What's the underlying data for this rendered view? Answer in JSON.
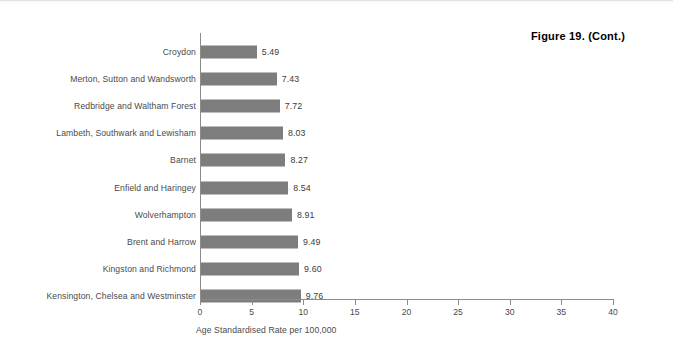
{
  "figure": {
    "caption": "Figure 19. (Cont.)"
  },
  "chart_data": {
    "type": "bar",
    "orientation": "horizontal",
    "title": "Figure 19. (Cont.)",
    "xlabel": "Age Standardised Rate per 100,000",
    "ylabel": "",
    "xlim": [
      0,
      40
    ],
    "xticks": [
      0,
      5,
      10,
      15,
      20,
      25,
      30,
      35,
      40
    ],
    "xtick_labels": [
      "0",
      "5",
      "10",
      "15",
      "20",
      "25",
      "30",
      "35",
      "40"
    ],
    "grid": false,
    "legend": false,
    "bar_color": "#7d7d7d",
    "axis_color": "#8c8c8c",
    "categories": [
      "Croydon",
      "Merton, Sutton and Wandsworth",
      "Redbridge and Waltham Forest",
      "Lambeth, Southwark and Lewisham",
      "Barnet",
      "Enfield and Haringey",
      "Wolverhampton",
      "Brent and Harrow",
      "Kingston and Richmond",
      "Kensington, Chelsea and Westminster"
    ],
    "values": [
      5.49,
      7.43,
      7.72,
      8.03,
      8.27,
      8.54,
      8.91,
      9.49,
      9.6,
      9.76
    ],
    "value_labels": [
      "5.49",
      "7.43",
      "7.72",
      "8.03",
      "8.27",
      "8.54",
      "8.91",
      "9.49",
      "9.60",
      "9.76"
    ]
  }
}
